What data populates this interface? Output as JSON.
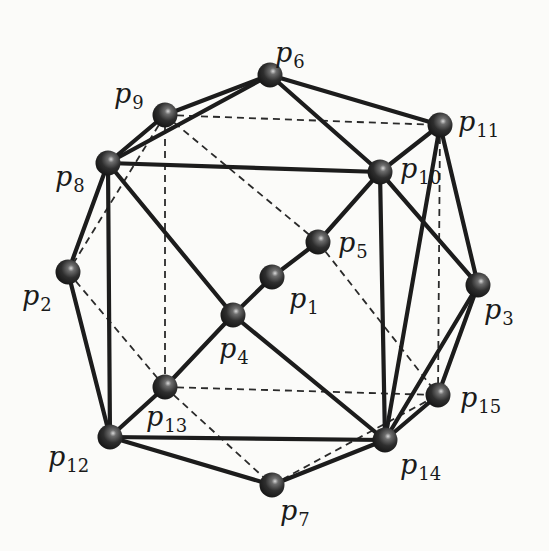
{
  "diagram": {
    "type": "polyhedron-graph",
    "background": "#fbfbf9",
    "node_color": "#2b2b2b",
    "edge_color": "#1c1c1c",
    "nodes": [
      {
        "id": "p1",
        "letter": "p",
        "index": "1",
        "x": 272,
        "y": 277,
        "label_x": 289,
        "label_y": 285
      },
      {
        "id": "p2",
        "letter": "p",
        "index": "2",
        "x": 68,
        "y": 272,
        "label_x": 22,
        "label_y": 282
      },
      {
        "id": "p3",
        "letter": "p",
        "index": "3",
        "x": 478,
        "y": 285,
        "label_x": 484,
        "label_y": 296
      },
      {
        "id": "p4",
        "letter": "p",
        "index": "4",
        "x": 233,
        "y": 315,
        "label_x": 219,
        "label_y": 335
      },
      {
        "id": "p5",
        "letter": "p",
        "index": "5",
        "x": 318,
        "y": 242,
        "label_x": 338,
        "label_y": 229
      },
      {
        "id": "p6",
        "letter": "p",
        "index": "6",
        "x": 270,
        "y": 75,
        "label_x": 275,
        "label_y": 39
      },
      {
        "id": "p7",
        "letter": "p",
        "index": "7",
        "x": 272,
        "y": 485,
        "label_x": 280,
        "label_y": 497
      },
      {
        "id": "p8",
        "letter": "p",
        "index": "8",
        "x": 108,
        "y": 163,
        "label_x": 55,
        "label_y": 163
      },
      {
        "id": "p9",
        "letter": "p",
        "index": "9",
        "x": 165,
        "y": 115,
        "label_x": 114,
        "label_y": 80
      },
      {
        "id": "p10",
        "letter": "p",
        "index": "10",
        "x": 380,
        "y": 172,
        "label_x": 400,
        "label_y": 155
      },
      {
        "id": "p11",
        "letter": "p",
        "index": "11",
        "x": 440,
        "y": 125,
        "label_x": 458,
        "label_y": 108
      },
      {
        "id": "p12",
        "letter": "p",
        "index": "12",
        "x": 110,
        "y": 437,
        "label_x": 48,
        "label_y": 443
      },
      {
        "id": "p13",
        "letter": "p",
        "index": "13",
        "x": 165,
        "y": 387,
        "label_x": 146,
        "label_y": 403
      },
      {
        "id": "p14",
        "letter": "p",
        "index": "14",
        "x": 385,
        "y": 440,
        "label_x": 400,
        "label_y": 451
      },
      {
        "id": "p15",
        "letter": "p",
        "index": "15",
        "x": 438,
        "y": 395,
        "label_x": 460,
        "label_y": 384
      }
    ],
    "edges_solid": [
      [
        "p6",
        "p9"
      ],
      [
        "p6",
        "p8"
      ],
      [
        "p6",
        "p11"
      ],
      [
        "p6",
        "p10"
      ],
      [
        "p8",
        "p9"
      ],
      [
        "p8",
        "p10"
      ],
      [
        "p8",
        "p2"
      ],
      [
        "p8",
        "p12"
      ],
      [
        "p8",
        "p4"
      ],
      [
        "p10",
        "p11"
      ],
      [
        "p10",
        "p3"
      ],
      [
        "p10",
        "p14"
      ],
      [
        "p10",
        "p5"
      ],
      [
        "p5",
        "p1"
      ],
      [
        "p1",
        "p4"
      ],
      [
        "p4",
        "p13"
      ],
      [
        "p13",
        "p12"
      ],
      [
        "p4",
        "p14"
      ],
      [
        "p11",
        "p3"
      ],
      [
        "p11",
        "p14"
      ],
      [
        "p3",
        "p15"
      ],
      [
        "p3",
        "p14"
      ],
      [
        "p15",
        "p14"
      ],
      [
        "p2",
        "p12"
      ],
      [
        "p12",
        "p14"
      ],
      [
        "p12",
        "p7"
      ],
      [
        "p7",
        "p14"
      ]
    ],
    "edges_dashed": [
      [
        "p9",
        "p11"
      ],
      [
        "p9",
        "p13"
      ],
      [
        "p9",
        "p5"
      ],
      [
        "p9",
        "p2"
      ],
      [
        "p11",
        "p15"
      ],
      [
        "p5",
        "p15"
      ],
      [
        "p2",
        "p13"
      ],
      [
        "p13",
        "p15"
      ],
      [
        "p13",
        "p7"
      ],
      [
        "p7",
        "p15"
      ]
    ]
  }
}
